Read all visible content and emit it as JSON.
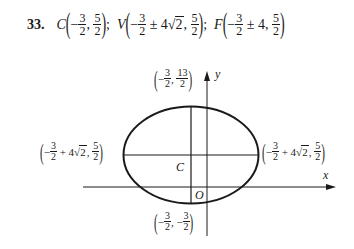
{
  "problem": {
    "number": "33.",
    "center": {
      "name": "C",
      "x_sign": "−",
      "x_num": "3",
      "x_den": "2",
      "sep": ",",
      "y_num": "5",
      "y_den": "2"
    },
    "vertices": {
      "name": "V",
      "x_sign": "−",
      "x_num": "3",
      "x_den": "2",
      "pm": "±",
      "coef": "4",
      "radical": "2",
      "sep": ",",
      "y_num": "5",
      "y_den": "2"
    },
    "foci": {
      "name": "F",
      "x_sign": "−",
      "x_num": "3",
      "x_den": "2",
      "pm": "±",
      "coef": "4",
      "sep": ",",
      "y_num": "5",
      "y_den": "2"
    },
    "separator": ";"
  },
  "graph": {
    "axis_x_label": "x",
    "axis_y_label": "y",
    "origin_label": "O",
    "center_label": "C",
    "top_point": {
      "x_sign": "−",
      "x_num": "3",
      "x_den": "2",
      "sep": ",",
      "y_num": "13",
      "y_den": "2"
    },
    "bottom_point": {
      "x_sign": "−",
      "x_num": "3",
      "x_den": "2",
      "sep": ",",
      "y_sign": "−",
      "y_num": "3",
      "y_den": "2"
    },
    "left_point": {
      "x_sign": "−",
      "x_num": "3",
      "x_den": "2",
      "op": "+",
      "coef": "4",
      "radical": "2",
      "sep": ",",
      "y_num": "5",
      "y_den": "2"
    },
    "right_point": {
      "x_sign": "−",
      "x_num": "3",
      "x_den": "2",
      "op": "+",
      "coef": "4",
      "radical": "2",
      "sep": ",",
      "y_num": "5",
      "y_den": "2"
    }
  }
}
